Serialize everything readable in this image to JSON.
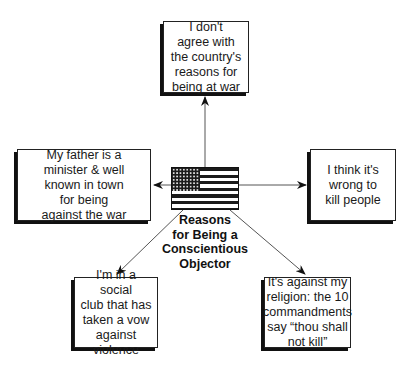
{
  "diagram": {
    "center": {
      "icon": "us-flag-icon",
      "label": "Reasons\nfor Being a\nConscientious\nObjector"
    },
    "reasons": [
      {
        "id": "top",
        "text": "I don't\nagree with\nthe country's\nreasons for\nbeing at war"
      },
      {
        "id": "left",
        "text": "My father is a\nminister & well\nknown in town\nfor being\nagainst the war"
      },
      {
        "id": "right",
        "text": "I think it's\nwrong to\nkill people"
      },
      {
        "id": "bottom_left",
        "text": "I'm in a social\nclub that has\ntaken a vow\nagainst\nviolence"
      },
      {
        "id": "bottom_right",
        "text": "It's against my\nreligion: the 10\ncommandments\nsay “thou shall\nnot kill”"
      }
    ],
    "colors": {
      "line": "#555555",
      "arrowhead": "#111111",
      "box_border": "#222222",
      "shadow": "#111111"
    }
  }
}
